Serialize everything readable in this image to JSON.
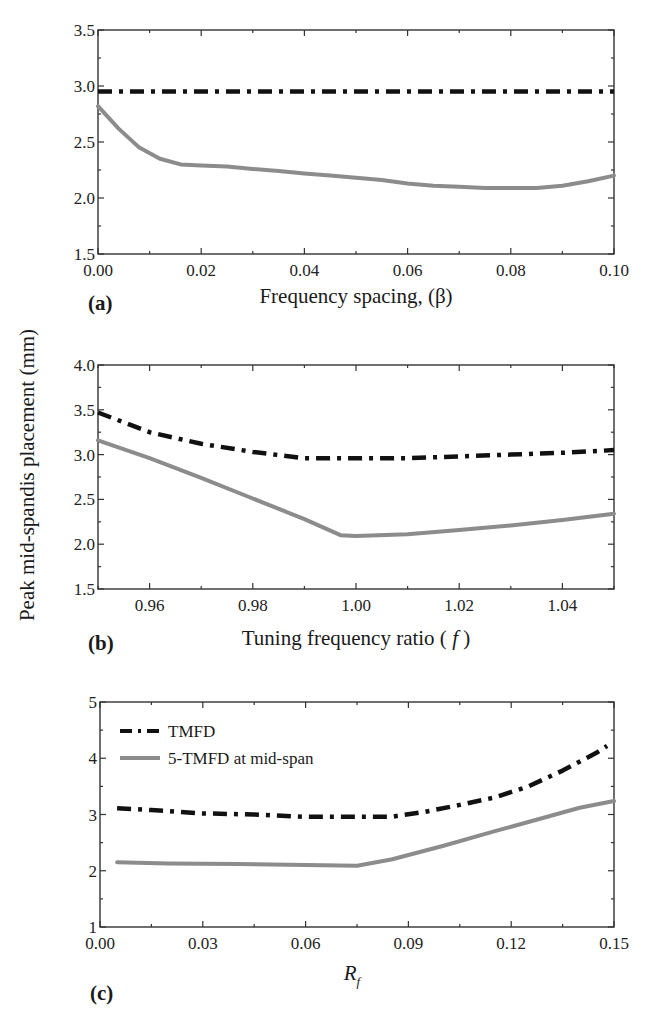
{
  "figure": {
    "shared_ylabel": "Peak mid-spandis placement (mm)"
  },
  "legend": {
    "items": [
      {
        "label": "TMFD",
        "style": "dashdot",
        "color": "#111111"
      },
      {
        "label": "5-TMFD at mid-span",
        "style": "solid",
        "color": "#8c8c8c"
      }
    ]
  },
  "chart_data": [
    {
      "type": "line",
      "panel": "(a)",
      "title": "",
      "xlabel": "Frequency spacing, (β)",
      "ylabel": "Peak mid-spandis placement (mm)",
      "xlim": [
        0.0,
        0.1
      ],
      "ylim": [
        1.5,
        3.5
      ],
      "xticks": [
        "0.00",
        "0.02",
        "0.04",
        "0.06",
        "0.08",
        "0.10"
      ],
      "yticks": [
        "1.5",
        "2.0",
        "2.5",
        "3.0",
        "3.5"
      ],
      "grid": false,
      "series": [
        {
          "name": "TMFD",
          "style": "dashdot",
          "color": "#111111",
          "x": [
            0.0,
            0.1
          ],
          "y": [
            2.95,
            2.95
          ]
        },
        {
          "name": "5-TMFD at mid-span",
          "style": "solid",
          "color": "#8c8c8c",
          "x": [
            0.0,
            0.004,
            0.008,
            0.012,
            0.016,
            0.02,
            0.025,
            0.03,
            0.035,
            0.04,
            0.045,
            0.05,
            0.055,
            0.06,
            0.065,
            0.07,
            0.075,
            0.08,
            0.085,
            0.09,
            0.095,
            0.1
          ],
          "y": [
            2.82,
            2.62,
            2.45,
            2.35,
            2.3,
            2.29,
            2.28,
            2.26,
            2.24,
            2.22,
            2.2,
            2.18,
            2.16,
            2.13,
            2.11,
            2.1,
            2.09,
            2.09,
            2.09,
            2.11,
            2.15,
            2.2
          ]
        }
      ]
    },
    {
      "type": "line",
      "panel": "(b)",
      "title": "",
      "xlabel": "Tuning frequency ratio ( f )",
      "ylabel": "Peak mid-spandis placement (mm)",
      "xlim": [
        0.95,
        1.05
      ],
      "ylim": [
        1.5,
        4.0
      ],
      "xticks": [
        "0.96",
        "0.98",
        "1.00",
        "1.02",
        "1.04"
      ],
      "yticks": [
        "1.5",
        "2.0",
        "2.5",
        "3.0",
        "3.5",
        "4.0"
      ],
      "grid": false,
      "series": [
        {
          "name": "TMFD",
          "style": "dashdot",
          "color": "#111111",
          "x": [
            0.95,
            0.96,
            0.97,
            0.98,
            0.99,
            1.0,
            1.01,
            1.02,
            1.03,
            1.04,
            1.05
          ],
          "y": [
            3.47,
            3.25,
            3.12,
            3.03,
            2.96,
            2.96,
            2.96,
            2.98,
            3.0,
            3.02,
            3.05
          ]
        },
        {
          "name": "5-TMFD at mid-span",
          "style": "solid",
          "color": "#8c8c8c",
          "x": [
            0.95,
            0.96,
            0.97,
            0.98,
            0.99,
            0.997,
            1.0,
            1.01,
            1.02,
            1.03,
            1.04,
            1.05
          ],
          "y": [
            3.16,
            2.96,
            2.74,
            2.51,
            2.28,
            2.1,
            2.09,
            2.11,
            2.16,
            2.21,
            2.27,
            2.34
          ]
        }
      ]
    },
    {
      "type": "line",
      "panel": "(c)",
      "title": "",
      "xlabel": "R_f",
      "ylabel": "Peak mid-spandis placement (mm)",
      "xlim": [
        0.0,
        0.15
      ],
      "ylim": [
        1,
        5
      ],
      "xticks": [
        "0.00",
        "0.03",
        "0.06",
        "0.09",
        "0.12",
        "0.15"
      ],
      "yticks": [
        "1",
        "2",
        "3",
        "4",
        "5"
      ],
      "grid": false,
      "legend_position": "upper left",
      "series": [
        {
          "name": "TMFD",
          "style": "dashdot",
          "color": "#111111",
          "x": [
            0.005,
            0.015,
            0.03,
            0.045,
            0.06,
            0.075,
            0.085,
            0.095,
            0.105,
            0.115,
            0.125,
            0.135,
            0.145,
            0.148
          ],
          "y": [
            3.11,
            3.08,
            3.02,
            3.0,
            2.96,
            2.96,
            2.96,
            3.05,
            3.17,
            3.3,
            3.5,
            3.78,
            4.1,
            4.22
          ]
        },
        {
          "name": "5-TMFD at mid-span",
          "style": "solid",
          "color": "#8c8c8c",
          "x": [
            0.005,
            0.02,
            0.04,
            0.06,
            0.075,
            0.085,
            0.1,
            0.115,
            0.13,
            0.14,
            0.15
          ],
          "y": [
            2.15,
            2.13,
            2.12,
            2.1,
            2.09,
            2.2,
            2.44,
            2.7,
            2.95,
            3.12,
            3.24
          ]
        }
      ]
    }
  ]
}
